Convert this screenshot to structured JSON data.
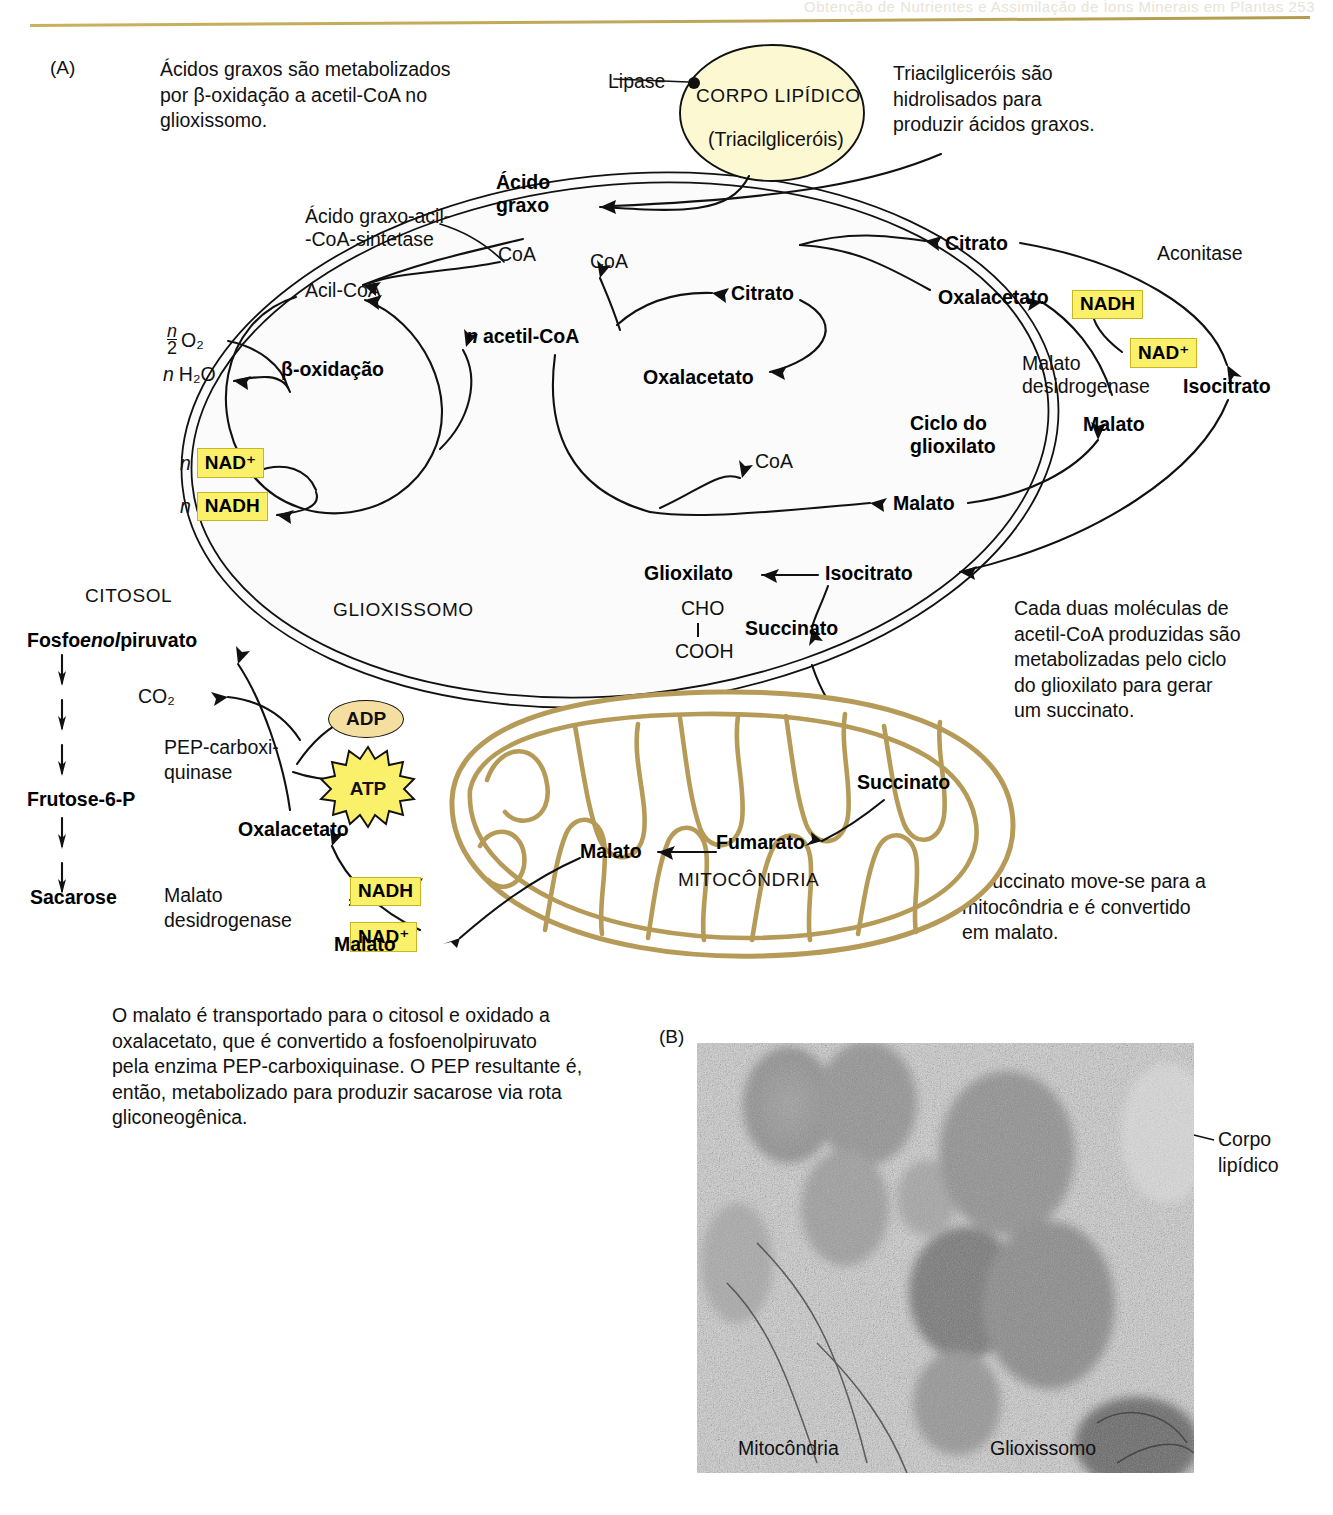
{
  "page": {
    "header_faint": "Obtenção de Nutrientes e Assimilação de Íons Minerais em Plantas   253",
    "panel_a_label": "(A)",
    "panel_b_label": "(B)"
  },
  "notes": {
    "beta_oxidation": "Ácidos graxos são metabolizados\npor β-oxidação a acetil-CoA no\nglioxissomo.",
    "triacylglycerols": "Triacilgliceróis são\nhidrolisados para\nproduzir ácidos graxos.",
    "glyoxylate_cycle": "Cada duas moléculas de\nacetil-CoA produzidas são\nmetabolizadas pelo ciclo\ndo glioxilato para gerar\num succinato.",
    "succinate_mito": "O succinato move-se para a\nmitocôndria e é convertido\nem malato.",
    "malate_cytosol": "O malato é transportado para o citosol e oxidado a\noxalacetato, que é convertido a fosfoenolpiruvato\npela enzima PEP-carboxiquinase. O PEP resultante é,\nentão, metabolizado para produzir sacarose via rota\ngliconeogênica."
  },
  "lipid_body": {
    "enzyme": "Lipase",
    "title": "CORPO LIPÍDICO",
    "subtitle": "(Triacilgliceróis)"
  },
  "compartments": {
    "cytosol": "CITOSOL",
    "glyoxysome": "GLIOXISSOMO",
    "mitochondrion": "MITOCÔNDRIA"
  },
  "glyoxysome": {
    "fatty_acid": "Ácido\ngraxo",
    "synthetase": "Ácido graxo-acil-\n-CoA-sintetase",
    "coa_1": "CoA",
    "acyl_coa": "Acil-CoA",
    "beta_oxidation": "β-oxidação",
    "o2": "O₂",
    "o2_coef_num": "n",
    "o2_coef_den": "2",
    "water": "H₂O",
    "water_coef": "n",
    "nad_plus_coef": "n",
    "nad_plus": "NAD⁺",
    "nadh_coef": "n",
    "nadh": "NADH",
    "n_acetyl_coa": "acetil-CoA",
    "n_acetyl_coa_coef": "n",
    "coa_2": "CoA",
    "citrate_inner": "Citrato",
    "oxaloacetate_inner": "Oxalacetato",
    "coa_3": "CoA",
    "malate_inner": "Malato",
    "glyoxylate": "Glioxilato",
    "glyoxylate_cho": "CHO",
    "glyoxylate_cooh": "COOH",
    "isocitrate_inner": "Isocitrato",
    "succinate": "Succinato",
    "cycle_title": "Ciclo do\nglioxilato",
    "citrate_outer": "Citrato",
    "aconitase": "Aconitase",
    "oxaloacetate_outer": "Oxalacetato",
    "nadh_cycle": "NADH",
    "nad_plus_cycle": "NAD⁺",
    "malate_dehydrogenase": "Malato\ndesidrogenase",
    "isocitrate_outer": "Isocitrato",
    "malate_outer": "Malato"
  },
  "cytosol": {
    "pep": "Fosfoenolpiruvato",
    "pep_italic_part": "enol",
    "co2": "CO₂",
    "pep_carboxykinase": "PEP-carboxi-\nquinase",
    "adp": "ADP",
    "atp": "ATP",
    "fructose_6p": "Frutose-6-P",
    "sucrose": "Sacarose",
    "oxaloacetate": "Oxalacetato",
    "malate_dehydrogenase": "Malato\ndesidrogenase",
    "nadh": "NADH",
    "nad_plus": "NAD⁺",
    "malate": "Malato"
  },
  "mitochondrion": {
    "succinate": "Succinato",
    "fumarate": "Fumarato",
    "malate": "Malato"
  },
  "micrograph_labels": {
    "lipid_body": "Corpo\nlipídico",
    "mitochondrion": "Mitocôndria",
    "glyoxysome": "Glioxissomo"
  },
  "colors": {
    "highlight_yellow": "#fbf06a",
    "lipid_fill": "#fbf8d2",
    "adp_fill": "#f5dfa0",
    "mito_membrane": "#b59b57",
    "rule": "#c9b15f"
  }
}
